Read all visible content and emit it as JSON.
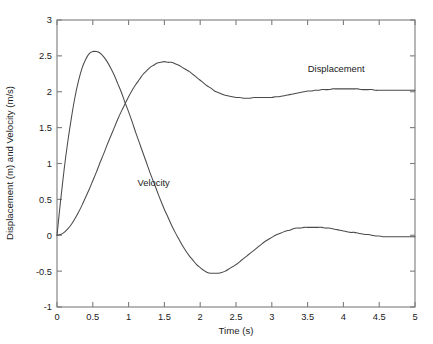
{
  "chart_data": {
    "type": "line",
    "title": "",
    "xlabel": "Time (s)",
    "ylabel": "Displacement (m) and Velocity (m/s)",
    "xlim": [
      0,
      5
    ],
    "ylim": [
      -1,
      3
    ],
    "grid": false,
    "legend_position": "inline-annotations",
    "xticks": [
      0,
      0.5,
      1,
      1.5,
      2,
      2.5,
      3,
      3.5,
      4,
      4.5,
      5
    ],
    "xtick_labels": [
      "0",
      "0.5",
      "1",
      "1.5",
      "2",
      "2.5",
      "3",
      "3.5",
      "4",
      "4.5",
      "5"
    ],
    "yticks": [
      -1,
      -0.5,
      0,
      0.5,
      1,
      1.5,
      2,
      2.5,
      3
    ],
    "ytick_labels": [
      "-1",
      "-0.5",
      "0",
      "0.5",
      "1",
      "1.5",
      "2",
      "2.5",
      "3"
    ],
    "x": [
      0,
      0.05,
      0.1,
      0.15,
      0.2,
      0.25,
      0.3,
      0.35,
      0.4,
      0.45,
      0.5,
      0.55,
      0.6,
      0.65,
      0.7,
      0.75,
      0.8,
      0.85,
      0.9,
      0.95,
      1,
      1.05,
      1.1,
      1.15,
      1.2,
      1.25,
      1.3,
      1.35,
      1.4,
      1.45,
      1.5,
      1.55,
      1.6,
      1.65,
      1.7,
      1.75,
      1.8,
      1.85,
      1.9,
      1.95,
      2,
      2.05,
      2.1,
      2.15,
      2.2,
      2.25,
      2.3,
      2.35,
      2.4,
      2.45,
      2.5,
      2.55,
      2.6,
      2.65,
      2.7,
      2.75,
      2.8,
      2.85,
      2.9,
      2.95,
      3,
      3.05,
      3.1,
      3.15,
      3.2,
      3.25,
      3.3,
      3.35,
      3.4,
      3.45,
      3.5,
      3.55,
      3.6,
      3.65,
      3.7,
      3.75,
      3.8,
      3.85,
      3.9,
      3.95,
      4,
      4.05,
      4.1,
      4.15,
      4.2,
      4.25,
      4.3,
      4.35,
      4.4,
      4.45,
      4.5,
      4.55,
      4.6,
      4.65,
      4.7,
      4.75,
      4.8,
      4.85,
      4.9,
      4.95,
      5
    ],
    "series": [
      {
        "name": "Displacement",
        "unit": "m",
        "annotation_label": "Displacement",
        "annotation_at": {
          "x": 3.9,
          "y": 2.27
        },
        "values": [
          0,
          0.01,
          0.04,
          0.09,
          0.15,
          0.23,
          0.32,
          0.42,
          0.53,
          0.64,
          0.76,
          0.88,
          1.01,
          1.13,
          1.26,
          1.38,
          1.5,
          1.62,
          1.73,
          1.83,
          1.93,
          2.02,
          2.1,
          2.17,
          2.24,
          2.29,
          2.34,
          2.37,
          2.4,
          2.41,
          2.42,
          2.41,
          2.41,
          2.39,
          2.37,
          2.34,
          2.31,
          2.28,
          2.24,
          2.2,
          2.16,
          2.12,
          2.08,
          2.05,
          2.01,
          1.99,
          1.97,
          1.95,
          1.94,
          1.93,
          1.92,
          1.92,
          1.91,
          1.91,
          1.91,
          1.92,
          1.92,
          1.92,
          1.92,
          1.92,
          1.92,
          1.93,
          1.93,
          1.94,
          1.95,
          1.96,
          1.97,
          1.98,
          1.99,
          2,
          2.01,
          2.01,
          2.02,
          2.02,
          2.03,
          2.03,
          2.03,
          2.04,
          2.04,
          2.04,
          2.04,
          2.04,
          2.04,
          2.04,
          2.04,
          2.03,
          2.03,
          2.03,
          2.03,
          2.02,
          2.02,
          2.02,
          2.02,
          2.02,
          2.02,
          2.02,
          2.02,
          2.02,
          2.02,
          2.02,
          2.02
        ],
        "key_points": {
          "start": {
            "x": 0,
            "y": 0
          },
          "first_peak": {
            "x": 1.52,
            "y": 2.42
          },
          "first_trough": {
            "x": 2.75,
            "y": 1.91
          },
          "second_peak": {
            "x": 3.95,
            "y": 2.04
          },
          "end": {
            "x": 5,
            "y": 2.02
          },
          "steady_state": 2.0
        }
      },
      {
        "name": "Velocity",
        "unit": "m/s",
        "annotation_label": "Velocity",
        "annotation_at": {
          "x": 1.35,
          "y": 0.68
        },
        "values": [
          0,
          0.48,
          0.92,
          1.3,
          1.63,
          1.92,
          2.15,
          2.33,
          2.45,
          2.53,
          2.56,
          2.56,
          2.54,
          2.49,
          2.42,
          2.33,
          2.23,
          2.11,
          1.99,
          1.85,
          1.72,
          1.58,
          1.43,
          1.29,
          1.15,
          1.01,
          0.87,
          0.74,
          0.61,
          0.48,
          0.36,
          0.25,
          0.14,
          0.04,
          -0.05,
          -0.14,
          -0.22,
          -0.29,
          -0.35,
          -0.41,
          -0.45,
          -0.49,
          -0.52,
          -0.53,
          -0.53,
          -0.53,
          -0.52,
          -0.5,
          -0.47,
          -0.44,
          -0.41,
          -0.37,
          -0.33,
          -0.29,
          -0.25,
          -0.21,
          -0.17,
          -0.13,
          -0.09,
          -0.06,
          -0.03,
          0,
          0.02,
          0.04,
          0.06,
          0.07,
          0.09,
          0.1,
          0.1,
          0.11,
          0.11,
          0.11,
          0.11,
          0.11,
          0.11,
          0.1,
          0.1,
          0.09,
          0.08,
          0.07,
          0.06,
          0.05,
          0.04,
          0.04,
          0.03,
          0.02,
          0.01,
          0.01,
          0,
          -0.01,
          -0.01,
          -0.02,
          -0.02,
          -0.02,
          -0.02,
          -0.02,
          -0.02,
          -0.02,
          -0.02,
          -0.02,
          -0.02
        ],
        "key_points": {
          "start": {
            "x": 0,
            "y": 0
          },
          "peak": {
            "x": 0.55,
            "y": 2.56
          },
          "zero_crossing": {
            "x": 1.67,
            "y": 0
          },
          "trough": {
            "x": 2.15,
            "y": -0.53
          },
          "second_peak": {
            "x": 3.65,
            "y": 0.11
          },
          "end": {
            "x": 5,
            "y": -0.02
          },
          "steady_state": 0.0
        }
      }
    ],
    "crossing_point": {
      "x": 0.93,
      "y": 1.81
    },
    "colors": {
      "line": "#4a4a4a",
      "axis": "#7c7c7c",
      "text": "#1a1a1a",
      "background": "#ffffff"
    }
  }
}
